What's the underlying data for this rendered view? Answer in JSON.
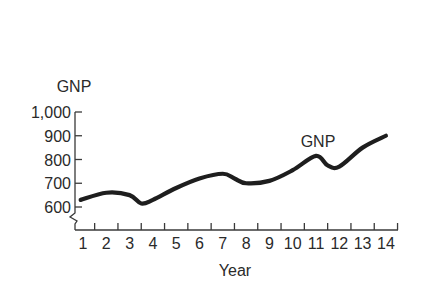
{
  "chart_data": {
    "type": "line",
    "title": "",
    "xlabel": "Year",
    "ylabel": "GNP",
    "x_ticks": [
      "1",
      "2",
      "3",
      "4",
      "5",
      "6",
      "7",
      "8",
      "9",
      "10",
      "11",
      "12",
      "13",
      "14"
    ],
    "y_ticks": [
      "600",
      "700",
      "800",
      "900",
      "1,000"
    ],
    "y_tick_values": [
      600,
      700,
      800,
      900,
      1000
    ],
    "ylim": [
      560,
      1000
    ],
    "xlim": [
      0.5,
      14.5
    ],
    "grid": false,
    "broken_y_axis": true,
    "legend": null,
    "annotations": [
      {
        "text": "GNP",
        "x": 11,
        "y": 880
      }
    ],
    "series": [
      {
        "name": "GNP",
        "x": [
          0.9,
          2,
          3,
          3.5,
          4,
          5,
          6,
          7,
          7.5,
          8,
          9,
          10,
          11,
          11.5,
          12,
          13,
          14
        ],
        "values": [
          630,
          660,
          650,
          615,
          630,
          680,
          720,
          740,
          720,
          700,
          710,
          755,
          815,
          775,
          770,
          850,
          900
        ]
      }
    ]
  }
}
